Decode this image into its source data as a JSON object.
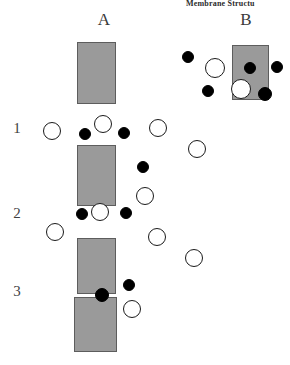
{
  "figure": {
    "caption_top": "Membrane Structu",
    "background_color": "#ffffff",
    "width": 290,
    "height": 365
  },
  "panels": [
    {
      "id": "A",
      "label": "A",
      "x": 92,
      "y": 10
    },
    {
      "id": "B",
      "label": "B",
      "x": 234,
      "y": 10
    }
  ],
  "row_labels": [
    {
      "id": "row-1",
      "label": "1",
      "x": 10,
      "y": 120
    },
    {
      "id": "row-2",
      "label": "2",
      "x": 10,
      "y": 205
    },
    {
      "id": "row-3",
      "label": "3",
      "x": 10,
      "y": 283
    }
  ],
  "colors": {
    "membrane_fill": "#9a9a9a",
    "membrane_stroke": "#5d5d5d",
    "particle_filled": "#000000",
    "particle_open_fill": "#ffffff",
    "particle_open_stroke": "#1a1a1a",
    "text": "#3a3a3a"
  },
  "membranes": [
    {
      "id": "membrane-a1",
      "panel": "A",
      "x": 77,
      "y": 42,
      "width": 39,
      "height": 62
    },
    {
      "id": "membrane-a2",
      "panel": "A",
      "x": 77,
      "y": 145,
      "width": 39,
      "height": 61
    },
    {
      "id": "membrane-a3",
      "panel": "A",
      "x": 77,
      "y": 238,
      "width": 39,
      "height": 56
    },
    {
      "id": "membrane-a4",
      "panel": "A",
      "x": 74,
      "y": 297,
      "width": 43,
      "height": 55
    },
    {
      "id": "membrane-b1",
      "panel": "B",
      "x": 232,
      "y": 45,
      "width": 37,
      "height": 55
    }
  ],
  "particles": [
    {
      "id": "p-a-open-1",
      "panel": "A",
      "type": "open",
      "cx": 103,
      "cy": 124,
      "r": 9
    },
    {
      "id": "p-a-filled-1",
      "panel": "A",
      "type": "filled",
      "cx": 85,
      "cy": 134,
      "r": 6
    },
    {
      "id": "p-a-filled-2",
      "panel": "A",
      "type": "filled",
      "cx": 124,
      "cy": 133,
      "r": 6
    },
    {
      "id": "p-a-open-2",
      "panel": "A",
      "type": "open",
      "cx": 52,
      "cy": 131,
      "r": 9
    },
    {
      "id": "p-a-open-3",
      "panel": "A",
      "type": "open",
      "cx": 158,
      "cy": 128,
      "r": 9
    },
    {
      "id": "p-a-open-4",
      "panel": "A",
      "type": "open",
      "cx": 197,
      "cy": 149,
      "r": 9
    },
    {
      "id": "p-a-filled-3",
      "panel": "A",
      "type": "filled",
      "cx": 143,
      "cy": 167,
      "r": 6
    },
    {
      "id": "p-a-open-5",
      "panel": "A",
      "type": "open",
      "cx": 145,
      "cy": 196,
      "r": 9
    },
    {
      "id": "p-a-open-6",
      "panel": "A",
      "type": "open",
      "cx": 100,
      "cy": 212,
      "r": 9
    },
    {
      "id": "p-a-filled-4",
      "panel": "A",
      "type": "filled",
      "cx": 82,
      "cy": 214,
      "r": 6
    },
    {
      "id": "p-a-filled-5",
      "panel": "A",
      "type": "filled",
      "cx": 126,
      "cy": 213,
      "r": 6
    },
    {
      "id": "p-a-open-7",
      "panel": "A",
      "type": "open",
      "cx": 55,
      "cy": 232,
      "r": 9
    },
    {
      "id": "p-a-open-8",
      "panel": "A",
      "type": "open",
      "cx": 157,
      "cy": 237,
      "r": 9
    },
    {
      "id": "p-a-open-9",
      "panel": "A",
      "type": "open",
      "cx": 194,
      "cy": 258,
      "r": 9
    },
    {
      "id": "p-a-filled-6",
      "panel": "A",
      "type": "filled",
      "cx": 129,
      "cy": 285,
      "r": 6
    },
    {
      "id": "p-a-filled-7",
      "panel": "A",
      "type": "filled",
      "cx": 102,
      "cy": 295,
      "r": 7
    },
    {
      "id": "p-a-open-10",
      "panel": "A",
      "type": "open",
      "cx": 132,
      "cy": 309,
      "r": 9
    },
    {
      "id": "p-b-filled-1",
      "panel": "B",
      "type": "filled",
      "cx": 188,
      "cy": 57,
      "r": 6
    },
    {
      "id": "p-b-open-1",
      "panel": "B",
      "type": "open",
      "cx": 215,
      "cy": 68,
      "r": 10
    },
    {
      "id": "p-b-filled-2",
      "panel": "B",
      "type": "filled",
      "cx": 208,
      "cy": 91,
      "r": 6
    },
    {
      "id": "p-b-filled-3",
      "panel": "B",
      "type": "filled",
      "cx": 250,
      "cy": 68,
      "r": 6
    },
    {
      "id": "p-b-open-2",
      "panel": "B",
      "type": "open",
      "cx": 241,
      "cy": 89,
      "r": 10
    },
    {
      "id": "p-b-filled-4",
      "panel": "B",
      "type": "filled",
      "cx": 265,
      "cy": 94,
      "r": 7
    },
    {
      "id": "p-b-filled-5",
      "panel": "B",
      "type": "filled",
      "cx": 277,
      "cy": 67,
      "r": 6
    }
  ]
}
